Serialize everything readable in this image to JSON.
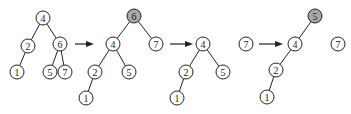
{
  "diagram": {
    "title": "",
    "node_radius": 7,
    "highlight_color": "#a8a8a8",
    "stroke_color": "#222222",
    "panels": [
      {
        "id": "tree1",
        "nodes": [
          {
            "id": "t1n4",
            "label": "4",
            "x": 43,
            "y": 18,
            "highlight": false
          },
          {
            "id": "t1n2",
            "label": "2",
            "x": 28,
            "y": 46,
            "highlight": false
          },
          {
            "id": "t1n6",
            "label": "6",
            "x": 60,
            "y": 44,
            "highlight": false
          },
          {
            "id": "t1n1",
            "label": "1",
            "x": 17,
            "y": 72,
            "highlight": false
          },
          {
            "id": "t1n5",
            "label": "5",
            "x": 50,
            "y": 72,
            "highlight": false
          },
          {
            "id": "t1n7",
            "label": "7",
            "x": 65,
            "y": 72,
            "highlight": false
          }
        ],
        "edges": [
          [
            "t1n4",
            "t1n2"
          ],
          [
            "t1n4",
            "t1n6"
          ],
          [
            "t1n2",
            "t1n1"
          ],
          [
            "t1n6",
            "t1n5"
          ],
          [
            "t1n6",
            "t1n7"
          ]
        ]
      },
      {
        "id": "tree2",
        "nodes": [
          {
            "id": "t2n6",
            "label": "6",
            "x": 134,
            "y": 16,
            "highlight": true
          },
          {
            "id": "t2n4",
            "label": "4",
            "x": 113,
            "y": 44,
            "highlight": false
          },
          {
            "id": "t2n7",
            "label": "7",
            "x": 156,
            "y": 44,
            "highlight": false
          },
          {
            "id": "t2n2",
            "label": "2",
            "x": 95,
            "y": 72,
            "highlight": false
          },
          {
            "id": "t2n5",
            "label": "5",
            "x": 129,
            "y": 72,
            "highlight": false
          },
          {
            "id": "t2n1",
            "label": "1",
            "x": 86,
            "y": 98,
            "highlight": false
          }
        ],
        "edges": [
          [
            "t2n6",
            "t2n4"
          ],
          [
            "t2n6",
            "t2n7"
          ],
          [
            "t2n4",
            "t2n2"
          ],
          [
            "t2n4",
            "t2n5"
          ],
          [
            "t2n2",
            "t2n1"
          ]
        ]
      },
      {
        "id": "tree3",
        "nodes": [
          {
            "id": "t3n4",
            "label": "4",
            "x": 203,
            "y": 44,
            "highlight": false
          },
          {
            "id": "t3n2",
            "label": "2",
            "x": 186,
            "y": 72,
            "highlight": false
          },
          {
            "id": "t3n5",
            "label": "5",
            "x": 223,
            "y": 72,
            "highlight": false
          },
          {
            "id": "t3n1",
            "label": "1",
            "x": 177,
            "y": 98,
            "highlight": false
          }
        ],
        "edges": [
          [
            "t3n4",
            "t3n2"
          ],
          [
            "t3n4",
            "t3n5"
          ],
          [
            "t3n2",
            "t3n1"
          ]
        ]
      },
      {
        "id": "tree4",
        "nodes": [
          {
            "id": "t4n7a",
            "label": "7",
            "x": 246,
            "y": 44,
            "highlight": false
          },
          {
            "id": "t4n5",
            "label": "5",
            "x": 315,
            "y": 16,
            "highlight": true
          },
          {
            "id": "t4n4",
            "label": "4",
            "x": 295,
            "y": 44,
            "highlight": false
          },
          {
            "id": "t4n7b",
            "label": "7",
            "x": 338,
            "y": 44,
            "highlight": false
          },
          {
            "id": "t4n2",
            "label": "2",
            "x": 276,
            "y": 70,
            "highlight": false
          },
          {
            "id": "t4n1",
            "label": "1",
            "x": 267,
            "y": 97,
            "highlight": false
          }
        ],
        "edges": [
          [
            "t4n5",
            "t4n4"
          ],
          [
            "t4n4",
            "t4n2"
          ],
          [
            "t4n2",
            "t4n1"
          ]
        ]
      }
    ],
    "arrows": [
      {
        "id": "arrow1",
        "x1": 75,
        "y1": 44,
        "x2": 94,
        "y2": 44
      },
      {
        "id": "arrow2",
        "x1": 170,
        "y1": 44,
        "x2": 193,
        "y2": 44
      },
      {
        "id": "arrow3",
        "x1": 259,
        "y1": 44,
        "x2": 283,
        "y2": 44
      }
    ]
  }
}
